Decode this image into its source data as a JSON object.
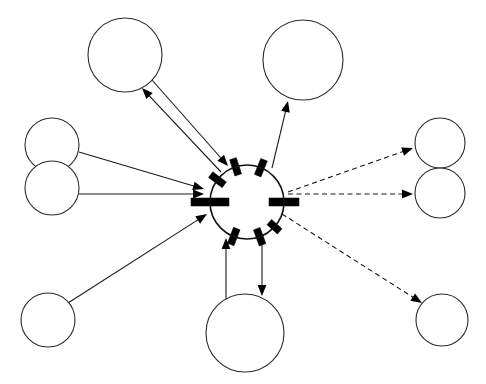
{
  "diagram": {
    "canvas": {
      "width": 486,
      "height": 384,
      "background": "#ffffff"
    },
    "style": {
      "node_stroke": "#2b2b2b",
      "hub_stroke": "#111111",
      "port_fill": "#000000",
      "edge_color": "#1a1a1a",
      "dash_pattern": "5 3.5"
    },
    "hub": {
      "id": "hub",
      "label": "",
      "cx": 247,
      "cy": 202,
      "r": 37,
      "port_count": 8
    },
    "ports": [
      {
        "id": "port-west",
        "label": "",
        "angle": 180,
        "length": 38,
        "thickness": 8
      },
      {
        "id": "port-east",
        "label": "",
        "angle": 0,
        "length": 30,
        "thickness": 8
      },
      {
        "id": "port-nw",
        "label": "",
        "angle": 143,
        "length": 17,
        "thickness": 7
      },
      {
        "id": "port-nnw",
        "label": "",
        "angle": 108,
        "length": 17,
        "thickness": 7
      },
      {
        "id": "port-nne",
        "label": "",
        "angle": 68,
        "length": 17,
        "thickness": 7
      },
      {
        "id": "port-sw",
        "label": "",
        "angle": 249,
        "length": 17,
        "thickness": 7
      },
      {
        "id": "port-sse",
        "label": "",
        "angle": 290,
        "length": 17,
        "thickness": 7
      },
      {
        "id": "port-se",
        "label": "",
        "angle": 318,
        "length": 14,
        "thickness": 7
      }
    ],
    "nodes": [
      {
        "id": "node-top-left",
        "label": "",
        "cx": 125,
        "cy": 55,
        "r": 37
      },
      {
        "id": "node-top-right",
        "label": "",
        "cx": 303,
        "cy": 60,
        "r": 40
      },
      {
        "id": "node-left-upper",
        "label": "",
        "cx": 52,
        "cy": 145,
        "r": 27
      },
      {
        "id": "node-left-lower",
        "label": "",
        "cx": 52,
        "cy": 188,
        "r": 27
      },
      {
        "id": "node-bottom-left",
        "label": "",
        "cx": 48,
        "cy": 320,
        "r": 27
      },
      {
        "id": "node-bottom-center",
        "label": "",
        "cx": 245,
        "cy": 333,
        "r": 39
      },
      {
        "id": "node-right-upper",
        "label": "",
        "cx": 440,
        "cy": 143,
        "r": 25
      },
      {
        "id": "node-right-lower",
        "label": "",
        "cx": 440,
        "cy": 193,
        "r": 25
      },
      {
        "id": "node-bottom-right",
        "label": "",
        "cx": 442,
        "cy": 320,
        "r": 26
      }
    ],
    "edges": [
      {
        "id": "edge-topleft-to-hub",
        "label": "",
        "style": "solid",
        "from": "node-top-left",
        "to": "hub",
        "x1": 152,
        "y1": 80,
        "x2": 228,
        "y2": 166,
        "arrow_at": "end"
      },
      {
        "id": "edge-hub-to-topleft",
        "label": "",
        "style": "solid",
        "from": "hub",
        "to": "node-top-left",
        "x1": 221,
        "y1": 172,
        "x2": 142,
        "y2": 88,
        "arrow_at": "end"
      },
      {
        "id": "edge-hub-to-topright",
        "label": "",
        "style": "solid",
        "from": "hub",
        "to": "node-top-right",
        "x1": 272,
        "y1": 168,
        "x2": 288,
        "y2": 101,
        "arrow_at": "end"
      },
      {
        "id": "edge-leftupper-to-hub",
        "label": "",
        "style": "solid",
        "from": "node-left-upper",
        "to": "hub",
        "x1": 79,
        "y1": 152,
        "x2": 204,
        "y2": 189,
        "arrow_at": "end"
      },
      {
        "id": "edge-leftlower-to-hub",
        "label": "",
        "style": "solid",
        "from": "node-left-lower",
        "to": "hub",
        "x1": 79,
        "y1": 194,
        "x2": 204,
        "y2": 194,
        "arrow_at": "end"
      },
      {
        "id": "edge-bottomleft-to-hub",
        "label": "",
        "style": "solid",
        "from": "node-bottom-left",
        "to": "hub",
        "x1": 68,
        "y1": 303,
        "x2": 207,
        "y2": 214,
        "arrow_at": "end"
      },
      {
        "id": "edge-bottomcenter-to-hub",
        "label": "",
        "style": "solid",
        "from": "node-bottom-center",
        "to": "hub",
        "x1": 226,
        "y1": 300,
        "x2": 226,
        "y2": 238,
        "arrow_at": "end"
      },
      {
        "id": "edge-hub-to-bottomcenter",
        "label": "",
        "style": "solid",
        "from": "hub",
        "to": "node-bottom-center",
        "x1": 262,
        "y1": 240,
        "x2": 262,
        "y2": 296,
        "arrow_at": "end"
      },
      {
        "id": "edge-hub-to-rightupper",
        "label": "",
        "style": "dashed",
        "from": "hub",
        "to": "node-right-upper",
        "x1": 288,
        "y1": 192,
        "x2": 413,
        "y2": 148,
        "arrow_at": "end"
      },
      {
        "id": "edge-hub-to-rightlower",
        "label": "",
        "style": "dashed",
        "from": "hub",
        "to": "node-right-lower",
        "x1": 288,
        "y1": 194,
        "x2": 413,
        "y2": 194,
        "arrow_at": "end"
      },
      {
        "id": "edge-hub-to-bottomright",
        "label": "",
        "style": "dashed",
        "from": "hub",
        "to": "node-bottom-right",
        "x1": 282,
        "y1": 214,
        "x2": 422,
        "y2": 303,
        "arrow_at": "end"
      }
    ],
    "counts": {
      "nodes_total": 10,
      "edges_total": 11,
      "solid_edges": 8,
      "dashed_edges": 3
    }
  }
}
